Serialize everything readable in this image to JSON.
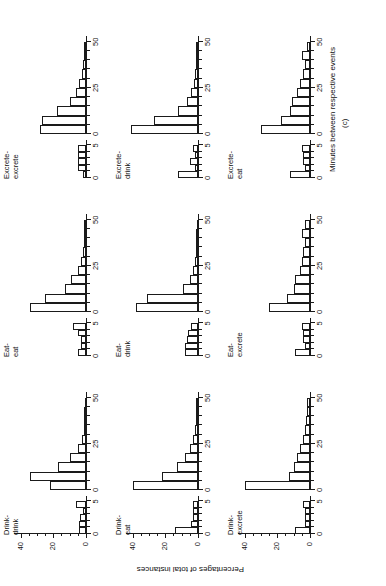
{
  "figure": {
    "label": "(c)",
    "x_axis_title": "Minutes between respective events",
    "y_axis_title": "Percentages of total instances"
  },
  "axes": {
    "main": {
      "tick_labels": [
        "0",
        "25",
        "50"
      ],
      "tick_values": [
        0,
        25,
        50
      ],
      "minor_step": 5,
      "xlim": [
        0,
        52
      ]
    },
    "inset": {
      "tick_labels": [
        "0",
        "5"
      ],
      "tick_values": [
        0,
        5
      ],
      "minor_step": 1,
      "xlim": [
        0,
        5.5
      ]
    },
    "y": {
      "tick_labels": [
        "0",
        "20",
        "40"
      ],
      "tick_values": [
        0,
        20,
        40
      ],
      "minor_step": 5,
      "ylim": [
        0,
        44
      ]
    }
  },
  "chart_data": {
    "type": "bar",
    "title": "(c)",
    "xlabel": "Minutes between respective events",
    "ylabel": "Percentages of total instances",
    "xlim_main": [
      0,
      52
    ],
    "xlim_inset": [
      0,
      5.5
    ],
    "ylim": [
      0,
      44
    ],
    "grid": false,
    "legend": "none",
    "note": "3x3 grid of histograms; each cell has a main histogram (0-50 min bins of 5 min) and an inset histogram (0-5 min bins of 1 min).",
    "panels": [
      {
        "name": "Drink-drink",
        "label": "Drink-\ndrink",
        "row": 0,
        "col": 0,
        "main": {
          "bin_width": 5,
          "bin_starts": [
            0,
            5,
            10,
            15,
            20,
            25,
            30,
            35,
            40,
            45
          ],
          "values": [
            22,
            34,
            17,
            10,
            5,
            2.5,
            1.5,
            1,
            1,
            0.8
          ]
        },
        "inset": {
          "bin_width": 1,
          "bin_starts": [
            0,
            1,
            2,
            3,
            4
          ],
          "values": [
            4.5,
            4.5,
            3.5,
            2,
            6
          ]
        }
      },
      {
        "name": "Eat-eat",
        "label": "Eat-\neat",
        "row": 0,
        "col": 1,
        "main": {
          "bin_width": 5,
          "bin_starts": [
            0,
            5,
            10,
            15,
            20,
            25,
            30,
            35,
            40,
            45
          ],
          "values": [
            34,
            25,
            13,
            9,
            5,
            3,
            2,
            1.5,
            1.2,
            1
          ]
        },
        "inset": {
          "bin_width": 1,
          "bin_starts": [
            0,
            1,
            2,
            3,
            4
          ],
          "values": [
            5,
            3,
            3,
            5,
            8
          ]
        }
      },
      {
        "name": "Excrete-excrete",
        "label": "Excrete-\nexcrete",
        "row": 0,
        "col": 2,
        "main": {
          "bin_width": 5,
          "bin_starts": [
            0,
            5,
            10,
            15,
            20,
            25,
            30,
            35,
            40,
            45
          ],
          "values": [
            28,
            27,
            18,
            10,
            6,
            4,
            2.5,
            2,
            1.5,
            1.2
          ]
        },
        "inset": {
          "bin_width": 1,
          "bin_starts": [
            0,
            1,
            2,
            3,
            4
          ],
          "values": [
            2,
            5,
            5,
            5,
            5
          ]
        }
      },
      {
        "name": "Drink-eat",
        "label": "Drink-\neat",
        "row": 1,
        "col": 0,
        "main": {
          "bin_width": 5,
          "bin_starts": [
            0,
            5,
            10,
            15,
            20,
            25,
            30,
            35,
            40,
            45
          ],
          "values": [
            40,
            22,
            13,
            8,
            5,
            3,
            2,
            1.5,
            1.2,
            1
          ]
        },
        "inset": {
          "bin_width": 1,
          "bin_starts": [
            0,
            1,
            2,
            3,
            4
          ],
          "values": [
            14,
            4,
            3,
            3,
            3
          ]
        }
      },
      {
        "name": "Eat-drink",
        "label": "Eat-\ndrink",
        "row": 1,
        "col": 1,
        "main": {
          "bin_width": 5,
          "bin_starts": [
            0,
            5,
            10,
            15,
            20,
            25,
            30,
            35,
            40,
            45
          ],
          "values": [
            38,
            31,
            9,
            5,
            3,
            2,
            1.5,
            1.2,
            1,
            0.8
          ]
        },
        "inset": {
          "bin_width": 1,
          "bin_starts": [
            0,
            1,
            2,
            3,
            4
          ],
          "values": [
            8,
            8,
            7,
            6,
            4
          ]
        }
      },
      {
        "name": "Excrete-drink",
        "label": "Excrete-\ndrink",
        "row": 1,
        "col": 2,
        "main": {
          "bin_width": 5,
          "bin_starts": [
            0,
            5,
            10,
            15,
            20,
            25,
            30,
            35,
            40,
            45
          ],
          "values": [
            41,
            27,
            12,
            7,
            4,
            2.5,
            2,
            1.5,
            1,
            1
          ]
        },
        "inset": {
          "bin_width": 1,
          "bin_starts": [
            0,
            1,
            2,
            3,
            4
          ],
          "values": [
            12,
            2,
            5,
            2,
            3
          ]
        }
      },
      {
        "name": "Drink-excrete",
        "label": "Drink-\nexcrete",
        "row": 2,
        "col": 0,
        "main": {
          "bin_width": 5,
          "bin_starts": [
            0,
            5,
            10,
            15,
            20,
            25,
            30,
            35,
            40,
            45
          ],
          "values": [
            40,
            13,
            10,
            8,
            6,
            4,
            3,
            2.5,
            2,
            2
          ]
        },
        "inset": {
          "bin_width": 1,
          "bin_starts": [
            0,
            1,
            2,
            3,
            4
          ],
          "values": [
            9,
            3,
            3,
            3,
            4
          ]
        }
      },
      {
        "name": "Eat-excrete",
        "label": "Eat-\nexcrete",
        "row": 2,
        "col": 1,
        "main": {
          "bin_width": 5,
          "bin_starts": [
            0,
            5,
            10,
            15,
            20,
            25,
            30,
            35,
            40,
            45
          ],
          "values": [
            25,
            14,
            10,
            9,
            6,
            5,
            4,
            3,
            5,
            3
          ]
        },
        "inset": {
          "bin_width": 1,
          "bin_starts": [
            0,
            1,
            2,
            3,
            4
          ],
          "values": [
            9,
            3,
            4,
            4,
            5
          ]
        }
      },
      {
        "name": "Excrete-eat",
        "label": "Excrete-\neat",
        "row": 2,
        "col": 2,
        "main": {
          "bin_width": 5,
          "bin_starts": [
            0,
            5,
            10,
            15,
            20,
            25,
            30,
            35,
            40,
            45
          ],
          "values": [
            30,
            18,
            12,
            11,
            8,
            6,
            4,
            3,
            5,
            2
          ]
        },
        "inset": {
          "bin_width": 1,
          "bin_starts": [
            0,
            1,
            2,
            3,
            4
          ],
          "values": [
            12,
            3,
            4,
            4,
            5
          ]
        }
      }
    ]
  }
}
